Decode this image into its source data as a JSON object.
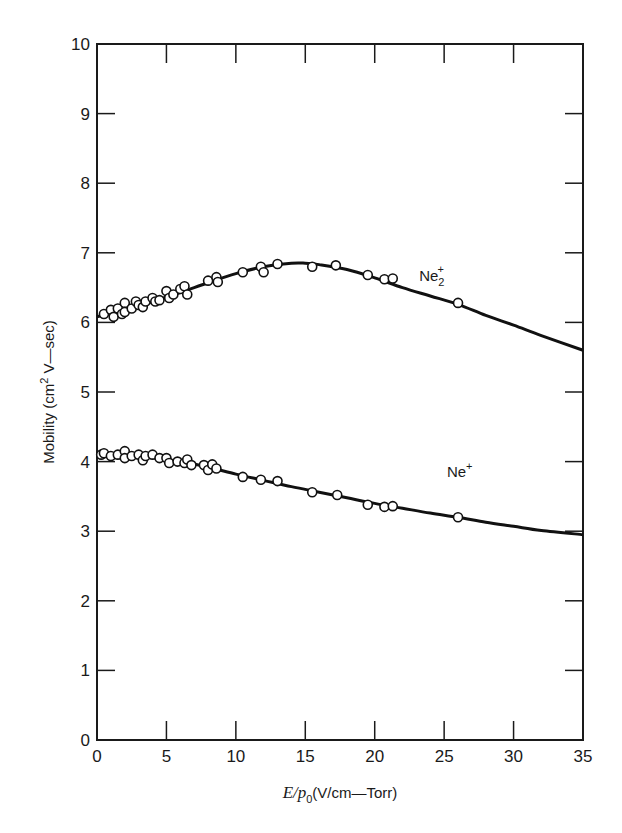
{
  "chart_data": {
    "type": "scatter",
    "title": "",
    "xlabel": "E/p0 (V/cm—Torr)",
    "xlabel_parts": {
      "italic": "E/p",
      "sub": "0",
      "rest": "(V/cm—Torr)"
    },
    "ylabel": "Mobility (cm2 V—sec)",
    "ylabel_parts": {
      "pre": "Mobility  (cm",
      "sup": "2",
      "post": " V—sec)"
    },
    "xlim": [
      0,
      35
    ],
    "ylim": [
      0,
      10
    ],
    "xticks": [
      0,
      5,
      10,
      15,
      20,
      25,
      30,
      35
    ],
    "yticks": [
      0,
      1,
      2,
      3,
      4,
      5,
      6,
      7,
      8,
      9,
      10
    ],
    "grid": false,
    "legend": "inline labels",
    "series": [
      {
        "name": "Ne2+",
        "label_base": "Ne",
        "label_sub": "2",
        "label_sup": "+",
        "label_pos": [
          23.2,
          6.6
        ],
        "curve": [
          [
            0,
            6.08
          ],
          [
            2,
            6.18
          ],
          [
            4,
            6.3
          ],
          [
            6,
            6.43
          ],
          [
            8,
            6.57
          ],
          [
            10,
            6.7
          ],
          [
            12,
            6.8
          ],
          [
            14,
            6.85
          ],
          [
            15,
            6.85
          ],
          [
            16,
            6.83
          ],
          [
            18,
            6.76
          ],
          [
            20,
            6.64
          ],
          [
            22,
            6.5
          ],
          [
            24,
            6.38
          ],
          [
            26,
            6.26
          ],
          [
            28,
            6.1
          ],
          [
            30,
            5.96
          ],
          [
            32,
            5.81
          ],
          [
            35,
            5.6
          ]
        ],
        "points": [
          [
            0.5,
            6.12
          ],
          [
            1.0,
            6.18
          ],
          [
            1.2,
            6.08
          ],
          [
            1.5,
            6.2
          ],
          [
            1.8,
            6.12
          ],
          [
            2.0,
            6.28
          ],
          [
            2.0,
            6.15
          ],
          [
            2.5,
            6.2
          ],
          [
            2.8,
            6.3
          ],
          [
            3.0,
            6.25
          ],
          [
            3.3,
            6.22
          ],
          [
            3.5,
            6.3
          ],
          [
            4.0,
            6.35
          ],
          [
            4.2,
            6.3
          ],
          [
            4.5,
            6.32
          ],
          [
            5.0,
            6.45
          ],
          [
            5.2,
            6.35
          ],
          [
            5.5,
            6.4
          ],
          [
            6.0,
            6.48
          ],
          [
            6.3,
            6.52
          ],
          [
            6.5,
            6.4
          ],
          [
            8.0,
            6.6
          ],
          [
            8.6,
            6.65
          ],
          [
            8.7,
            6.58
          ],
          [
            10.5,
            6.72
          ],
          [
            11.8,
            6.8
          ],
          [
            12.0,
            6.72
          ],
          [
            13.0,
            6.84
          ],
          [
            15.5,
            6.8
          ],
          [
            17.2,
            6.82
          ],
          [
            19.5,
            6.68
          ],
          [
            20.7,
            6.62
          ],
          [
            21.3,
            6.63
          ],
          [
            26.0,
            6.28
          ]
        ]
      },
      {
        "name": "Ne+",
        "label_base": "Ne",
        "label_sub": "",
        "label_sup": "+",
        "label_pos": [
          25.2,
          3.78
        ],
        "curve": [
          [
            0,
            4.1
          ],
          [
            2,
            4.1
          ],
          [
            4,
            4.06
          ],
          [
            6,
            4.0
          ],
          [
            8,
            3.92
          ],
          [
            10,
            3.82
          ],
          [
            12,
            3.73
          ],
          [
            14,
            3.64
          ],
          [
            16,
            3.56
          ],
          [
            18,
            3.48
          ],
          [
            20,
            3.4
          ],
          [
            22,
            3.33
          ],
          [
            24,
            3.26
          ],
          [
            26,
            3.2
          ],
          [
            28,
            3.13
          ],
          [
            30,
            3.07
          ],
          [
            32,
            3.01
          ],
          [
            35,
            2.95
          ]
        ],
        "points": [
          [
            0.3,
            4.1
          ],
          [
            0.5,
            4.12
          ],
          [
            1.0,
            4.08
          ],
          [
            1.5,
            4.1
          ],
          [
            2.0,
            4.15
          ],
          [
            2.0,
            4.05
          ],
          [
            2.5,
            4.08
          ],
          [
            3.0,
            4.1
          ],
          [
            3.3,
            4.02
          ],
          [
            3.5,
            4.08
          ],
          [
            4.0,
            4.1
          ],
          [
            4.5,
            4.05
          ],
          [
            5.0,
            4.05
          ],
          [
            5.2,
            3.98
          ],
          [
            5.8,
            4.0
          ],
          [
            6.3,
            3.98
          ],
          [
            6.5,
            4.03
          ],
          [
            6.8,
            3.95
          ],
          [
            7.7,
            3.95
          ],
          [
            8.0,
            3.88
          ],
          [
            8.3,
            3.96
          ],
          [
            8.6,
            3.9
          ],
          [
            10.5,
            3.78
          ],
          [
            11.8,
            3.74
          ],
          [
            13.0,
            3.72
          ],
          [
            15.5,
            3.56
          ],
          [
            17.3,
            3.52
          ],
          [
            19.5,
            3.38
          ],
          [
            20.7,
            3.35
          ],
          [
            21.3,
            3.36
          ],
          [
            26.0,
            3.2
          ]
        ]
      }
    ]
  }
}
